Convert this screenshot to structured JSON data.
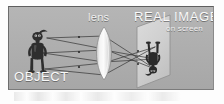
{
  "figure": {
    "panel": {
      "background_color": "#adadad",
      "border_color": "#6d6d6d"
    },
    "labels": {
      "lens": "lens",
      "real_image": "REAL IMAGE",
      "on_screen": "on screen",
      "object": "OBJECT"
    },
    "elements": {
      "object_icon": "object-figure-icon",
      "lens_icon": "biconvex-lens-icon",
      "screen_icon": "projection-screen-icon",
      "image_icon": "inverted-image-figure-icon",
      "rays_icon": "light-rays-icon"
    },
    "colors": {
      "label_text": "#f7f7f7",
      "lens_fill": "#e8e8e8",
      "screen_fill": "#d2d2d2",
      "ray_line": "#3a3a3a",
      "silhouette": "#2d2d2d"
    },
    "optics": {
      "ray_count": 3,
      "object_position": "left of lens",
      "image_position": "right of lens, on screen",
      "image_orientation": "inverted",
      "image_type": "real"
    }
  }
}
